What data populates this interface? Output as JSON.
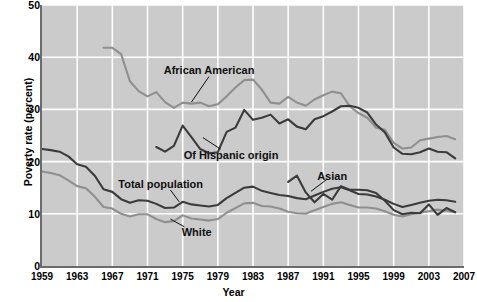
{
  "chart_data": {
    "type": "line",
    "title": "",
    "xlabel": "Year",
    "ylabel": "Poverty rate (percent)",
    "xlim": [
      1959,
      2007
    ],
    "ylim": [
      0,
      50
    ],
    "grid": true,
    "legend_position": "inline-annotations",
    "xticks": [
      "1959",
      "1963",
      "1967",
      "1971",
      "1975",
      "1979",
      "1983",
      "1987",
      "1991",
      "1995",
      "1999",
      "2003",
      "2007"
    ],
    "yticks": [
      "0",
      "10",
      "20",
      "30",
      "40",
      "50"
    ],
    "annotations": [
      {
        "label": "African American",
        "x": 1978.0,
        "y": 37.6
      },
      {
        "label": "Of Hispanic origin",
        "x": 1980.5,
        "y": 21.2
      },
      {
        "label": "Total population",
        "x": 1972.5,
        "y": 15.7
      },
      {
        "label": "White",
        "x": 1976.6,
        "y": 6.6
      },
      {
        "label": "Asian",
        "x": 1992.0,
        "y": 17.3
      }
    ],
    "series": [
      {
        "name": "African American",
        "color": "#8f8f8f",
        "x": [
          1966,
          1967,
          1968,
          1969,
          1970,
          1971,
          1972,
          1973,
          1974,
          1975,
          1976,
          1977,
          1978,
          1979,
          1980,
          1981,
          1982,
          1983,
          1984,
          1985,
          1986,
          1987,
          1988,
          1989,
          1990,
          1991,
          1992,
          1993,
          1994,
          1995,
          1996,
          1997,
          1998,
          1999,
          2000,
          2001,
          2002,
          2003,
          2004,
          2005,
          2006
        ],
        "y": [
          41.8,
          41.8,
          40.6,
          35.4,
          33.5,
          32.5,
          33.3,
          31.4,
          30.3,
          31.3,
          31.1,
          31.3,
          30.6,
          31.0,
          32.5,
          34.2,
          35.6,
          35.7,
          33.8,
          31.3,
          31.1,
          32.4,
          31.3,
          30.7,
          31.9,
          32.7,
          33.4,
          33.1,
          30.6,
          29.3,
          28.4,
          26.5,
          26.1,
          23.6,
          22.5,
          22.7,
          24.1,
          24.4,
          24.7,
          24.9,
          24.3
        ]
      },
      {
        "name": "Of Hispanic origin",
        "color": "#3b3b3b",
        "x": [
          1972,
          1973,
          1974,
          1975,
          1976,
          1977,
          1978,
          1979,
          1980,
          1981,
          1982,
          1983,
          1984,
          1985,
          1986,
          1987,
          1988,
          1989,
          1990,
          1991,
          1992,
          1993,
          1994,
          1995,
          1996,
          1997,
          1998,
          1999,
          2000,
          2001,
          2002,
          2003,
          2004,
          2005,
          2006
        ],
        "y": [
          22.8,
          21.9,
          23.0,
          26.9,
          24.7,
          22.4,
          21.6,
          21.8,
          25.7,
          26.5,
          29.9,
          28.0,
          28.4,
          29.0,
          27.3,
          28.1,
          26.7,
          26.2,
          28.1,
          28.7,
          29.6,
          30.6,
          30.7,
          30.3,
          29.4,
          27.1,
          25.6,
          22.7,
          21.5,
          21.4,
          21.8,
          22.5,
          21.9,
          21.8,
          20.6
        ]
      },
      {
        "name": "Total population",
        "color": "#3b3b3b",
        "x": [
          1959,
          1960,
          1961,
          1962,
          1963,
          1964,
          1965,
          1966,
          1967,
          1968,
          1969,
          1970,
          1971,
          1972,
          1973,
          1974,
          1975,
          1976,
          1977,
          1978,
          1979,
          1980,
          1981,
          1982,
          1983,
          1984,
          1985,
          1986,
          1987,
          1988,
          1989,
          1990,
          1991,
          1992,
          1993,
          1994,
          1995,
          1996,
          1997,
          1998,
          1999,
          2000,
          2001,
          2002,
          2003,
          2004,
          2005,
          2006
        ],
        "y": [
          22.4,
          22.2,
          21.9,
          21.0,
          19.5,
          19.0,
          17.3,
          14.7,
          14.2,
          12.8,
          12.1,
          12.6,
          12.5,
          11.9,
          11.1,
          11.2,
          12.3,
          11.8,
          11.6,
          11.4,
          11.7,
          13.0,
          14.0,
          15.0,
          15.2,
          14.4,
          14.0,
          13.6,
          13.4,
          13.0,
          12.8,
          13.5,
          14.2,
          14.8,
          15.1,
          14.5,
          13.8,
          13.7,
          13.3,
          12.7,
          11.9,
          11.3,
          11.7,
          12.1,
          12.5,
          12.7,
          12.6,
          12.3
        ]
      },
      {
        "name": "White",
        "color": "#8f8f8f",
        "x": [
          1959,
          1960,
          1961,
          1962,
          1963,
          1964,
          1965,
          1966,
          1967,
          1968,
          1969,
          1970,
          1971,
          1972,
          1973,
          1974,
          1975,
          1976,
          1977,
          1978,
          1979,
          1980,
          1981,
          1982,
          1983,
          1984,
          1985,
          1986,
          1987,
          1988,
          1989,
          1990,
          1991,
          1992,
          1993,
          1994,
          1995,
          1996,
          1997,
          1998,
          1999,
          2000,
          2001,
          2002,
          2003,
          2004,
          2005,
          2006
        ],
        "y": [
          18.1,
          17.8,
          17.4,
          16.4,
          15.3,
          14.9,
          13.3,
          11.3,
          11.0,
          10.0,
          9.5,
          9.9,
          9.9,
          9.0,
          8.4,
          8.6,
          9.7,
          9.1,
          8.9,
          8.7,
          9.0,
          10.2,
          11.1,
          12.0,
          12.1,
          11.5,
          11.4,
          11.0,
          10.4,
          10.1,
          10.0,
          10.7,
          11.3,
          11.9,
          12.2,
          11.7,
          11.2,
          11.2,
          11.0,
          10.5,
          9.8,
          9.5,
          9.9,
          10.2,
          10.5,
          10.8,
          10.6,
          10.3
        ]
      },
      {
        "name": "Asian",
        "color": "#3b3b3b",
        "x": [
          1987,
          1988,
          1989,
          1990,
          1991,
          1992,
          1993,
          1994,
          1995,
          1996,
          1997,
          1998,
          1999,
          2000,
          2001,
          2002,
          2003,
          2004,
          2005,
          2006
        ],
        "y": [
          16.1,
          17.3,
          14.1,
          12.2,
          13.8,
          12.7,
          15.3,
          14.6,
          14.6,
          14.5,
          14.0,
          12.5,
          10.7,
          9.9,
          10.2,
          10.1,
          11.8,
          9.8,
          11.1,
          10.3
        ]
      }
    ]
  }
}
